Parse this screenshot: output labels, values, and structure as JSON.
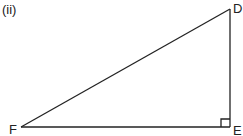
{
  "figure": {
    "part_label": "(ii)",
    "shape": "right-triangle",
    "vertices": [
      {
        "name": "D",
        "x": 230,
        "y": 9
      },
      {
        "name": "E",
        "x": 230,
        "y": 127
      },
      {
        "name": "F",
        "x": 21,
        "y": 127
      }
    ],
    "right_angle_at": "E",
    "line_color": "#222222"
  }
}
